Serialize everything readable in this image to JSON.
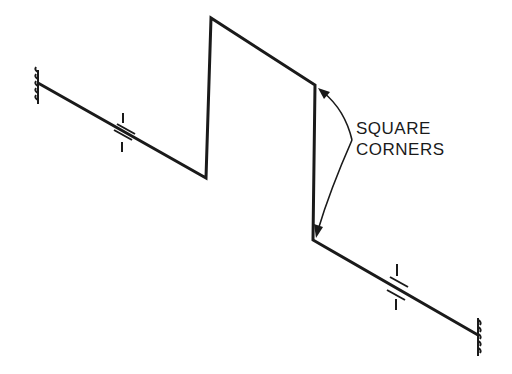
{
  "diagram": {
    "type": "isometric-pipe-offset",
    "annotation": {
      "line1": "SQUARE",
      "line2": "CORNERS"
    },
    "colors": {
      "line": "#1a1a1a",
      "background": "#ffffff"
    },
    "elements": [
      "left-anchor",
      "left-break-symbol",
      "upper-square-corner",
      "lower-square-corner",
      "right-break-symbol",
      "right-anchor"
    ]
  }
}
